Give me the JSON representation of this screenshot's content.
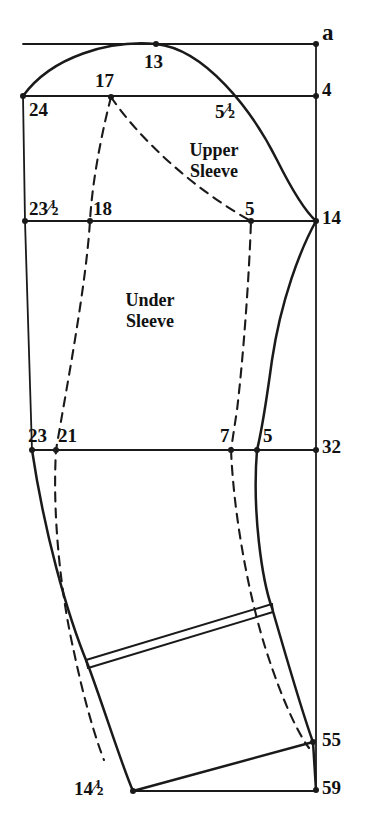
{
  "figure": {
    "ink_color": "#1a1a1a",
    "background_color": "#ffffff"
  },
  "regions": [
    {
      "id": "upper-sleeve",
      "line1": "Upper",
      "line2": "Sleeve",
      "x": 214,
      "y": 140
    },
    {
      "id": "under-sleeve",
      "line1": "Under",
      "line2": "Sleeve",
      "x": 150,
      "y": 290
    }
  ],
  "point_labels": [
    {
      "id": "a",
      "text": "a",
      "whole": "a",
      "frac": "",
      "x": 322,
      "y": 21,
      "size": "a"
    },
    {
      "id": "13",
      "text": "13",
      "whole": "13",
      "frac": "",
      "x": 144,
      "y": 52,
      "size": "num"
    },
    {
      "id": "4",
      "text": "4",
      "whole": "4",
      "frac": "",
      "x": 322,
      "y": 80,
      "size": "num"
    },
    {
      "id": "17",
      "text": "17",
      "whole": "17",
      "frac": "",
      "x": 95,
      "y": 71,
      "size": "num"
    },
    {
      "id": "24",
      "text": "24",
      "whole": "24",
      "frac": "",
      "x": 29,
      "y": 100,
      "size": "num"
    },
    {
      "id": "5half",
      "text": "5 1/2",
      "whole": "5",
      "frac": "1/2",
      "x": 215,
      "y": 102,
      "size": "num"
    },
    {
      "id": "23half",
      "text": "23 1/2",
      "whole": "23",
      "frac": "1/2",
      "x": 29,
      "y": 199,
      "size": "num"
    },
    {
      "id": "18",
      "text": "18",
      "whole": "18",
      "frac": "",
      "x": 93,
      "y": 199,
      "size": "num"
    },
    {
      "id": "5-mid",
      "text": "5",
      "whole": "5",
      "frac": "",
      "x": 245,
      "y": 199,
      "size": "num"
    },
    {
      "id": "14",
      "text": "14",
      "whole": "14",
      "frac": "",
      "x": 322,
      "y": 208,
      "size": "num"
    },
    {
      "id": "23",
      "text": "23",
      "whole": "23",
      "frac": "",
      "x": 28,
      "y": 426,
      "size": "num"
    },
    {
      "id": "21",
      "text": "21",
      "whole": "21",
      "frac": "",
      "x": 58,
      "y": 426,
      "size": "num"
    },
    {
      "id": "7",
      "text": "7",
      "whole": "7",
      "frac": "",
      "x": 220,
      "y": 426,
      "size": "num"
    },
    {
      "id": "5-low",
      "text": "5",
      "whole": "5",
      "frac": "",
      "x": 263,
      "y": 426,
      "size": "num"
    },
    {
      "id": "32",
      "text": "32",
      "whole": "32",
      "frac": "",
      "x": 322,
      "y": 437,
      "size": "num"
    },
    {
      "id": "55",
      "text": "55",
      "whole": "55",
      "frac": "",
      "x": 322,
      "y": 730,
      "size": "num"
    },
    {
      "id": "59",
      "text": "59",
      "whole": "59",
      "frac": "",
      "x": 322,
      "y": 778,
      "size": "num"
    },
    {
      "id": "14half",
      "text": "14 1/2",
      "whole": "14",
      "frac": "1/2",
      "x": 74,
      "y": 779,
      "size": "num"
    }
  ],
  "geometry": {
    "solid_color": "#1a1a1a",
    "dashed_color": "#1a1a1a",
    "stroke_width": 2.1,
    "dash_pattern": "9 7",
    "construction_lines": [
      {
        "id": "right-vertical",
        "from": [
          316,
          44
        ],
        "to": [
          316,
          790
        ]
      },
      {
        "id": "top-horizontal",
        "from": [
          23,
          44
        ],
        "to": [
          316,
          44
        ]
      },
      {
        "id": "line-4",
        "from": [
          23,
          96
        ],
        "to": [
          316,
          96
        ]
      },
      {
        "id": "line-14",
        "from": [
          25,
          221
        ],
        "to": [
          316,
          221
        ]
      },
      {
        "id": "line-32",
        "from": [
          32,
          450
        ],
        "to": [
          316,
          450
        ]
      },
      {
        "id": "bottom-59",
        "from": [
          133,
          791
        ],
        "to": [
          316,
          791
        ]
      },
      {
        "id": "left-upper-edge",
        "from": [
          23,
          96
        ],
        "to": [
          25,
          221
        ]
      },
      {
        "id": "left-under-edge",
        "from": [
          25,
          221
        ],
        "to": [
          32,
          450
        ]
      }
    ],
    "solid_curves": [
      {
        "id": "sleeve-head-curve",
        "path": "M 23 96 C 52 56, 110 40, 156 44 C 205 49, 252 110, 277 160 C 292 190, 306 212, 316 221"
      },
      {
        "id": "right-under-curve",
        "path": "M 316 221 C 300 250, 281 300, 272 360 C 266 404, 261 434, 257 450"
      },
      {
        "id": "right-lower-curve",
        "path": "M 257 450 C 252 512, 262 580, 272 608 C 287 660, 303 715, 313 742"
      },
      {
        "id": "left-lower-curve",
        "path": "M 32 450 C 44 530, 66 612, 88 665 C 104 708, 122 766, 133 791"
      },
      {
        "id": "hem-line",
        "path": "M 133 791 L 313 742"
      },
      {
        "id": "wrist-55-59",
        "path": "M 313 742 L 316 790"
      }
    ],
    "cuff_band": [
      {
        "id": "cuff-top-line",
        "path": "M 86 660 L 272 604"
      },
      {
        "id": "cuff-bottom-line",
        "path": "M 88 668 L 273 612"
      },
      {
        "id": "cuff-left-cap",
        "path": "M 86 660 L 88 668"
      },
      {
        "id": "cuff-right-cap",
        "path": "M 272 604 L 273 612"
      }
    ],
    "dashed_curves": [
      {
        "id": "dash-17-to-18-to-21",
        "path": "M 111 97 C 100 140, 92 185, 90 221 C 86 285, 68 380, 56 450 C 52 520, 62 600, 74 652 C 84 700, 96 740, 104 760"
      },
      {
        "id": "dash-17-to-5-to-7",
        "path": "M 111 97 C 140 140, 195 190, 251 221 C 249 280, 243 360, 237 410 C 234 430, 232 443, 231 450"
      },
      {
        "id": "dash-7-to-55",
        "path": "M 231 450 C 234 520, 250 600, 266 650 C 284 706, 300 736, 309 748"
      }
    ],
    "vertices": [
      {
        "id": "v-a",
        "x": 316,
        "y": 44
      },
      {
        "id": "v-13",
        "x": 156,
        "y": 44
      },
      {
        "id": "v-24",
        "x": 23,
        "y": 96
      },
      {
        "id": "v-17",
        "x": 111,
        "y": 97
      },
      {
        "id": "v-4",
        "x": 316,
        "y": 96
      },
      {
        "id": "v-23half",
        "x": 25,
        "y": 221
      },
      {
        "id": "v-18",
        "x": 90,
        "y": 221
      },
      {
        "id": "v-5mid",
        "x": 251,
        "y": 221
      },
      {
        "id": "v-14",
        "x": 316,
        "y": 221
      },
      {
        "id": "v-23",
        "x": 32,
        "y": 450
      },
      {
        "id": "v-21",
        "x": 56,
        "y": 450
      },
      {
        "id": "v-7",
        "x": 231,
        "y": 450
      },
      {
        "id": "v-5low",
        "x": 257,
        "y": 450
      },
      {
        "id": "v-32",
        "x": 316,
        "y": 450
      },
      {
        "id": "v-55",
        "x": 313,
        "y": 742
      },
      {
        "id": "v-59",
        "x": 316,
        "y": 790
      },
      {
        "id": "v-14half",
        "x": 133,
        "y": 791
      }
    ]
  }
}
